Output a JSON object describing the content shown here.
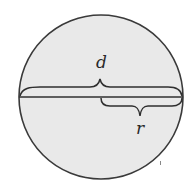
{
  "diagram": {
    "title": "",
    "shape": "circle",
    "colors": {
      "background": "#ffffff",
      "fill": "#e9e9e9",
      "stroke": "#3a3a3a"
    },
    "circle": {
      "cx": 101,
      "cy": 97,
      "r": 82
    },
    "labels": {
      "diameter": "d",
      "radius": "r"
    },
    "annotations": [
      {
        "label": "d",
        "meaning": "diameter",
        "span": "full horizontal chord through center, brace above"
      },
      {
        "label": "r",
        "meaning": "radius",
        "span": "center to right edge, brace below"
      }
    ]
  }
}
